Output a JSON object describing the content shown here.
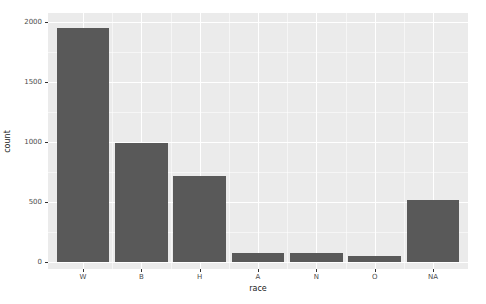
{
  "figure": {
    "background": "#FFFFFF"
  },
  "chart_data": {
    "type": "bar",
    "categories": [
      "W",
      "B",
      "H",
      "A",
      "N",
      "O",
      "NA"
    ],
    "values": [
      1948,
      995,
      720,
      78,
      72,
      50,
      520
    ],
    "title": "",
    "xlabel": "race",
    "ylabel": "count",
    "ylim": [
      -58,
      2075
    ],
    "y_major_ticks": [
      0,
      500,
      1000,
      1500,
      2000
    ],
    "y_minor_ticks": [
      250,
      750,
      1250,
      1750
    ],
    "grid": true,
    "legend": false,
    "colors": {
      "bar_fill": "#595959",
      "panel_background": "#EBEBEB",
      "grid_major": "#FFFFFF",
      "grid_minor": "rgba(255,255,255,0.55)",
      "tick_label_text": "#4D4D4D",
      "axis_title_text": "#1A1A1A",
      "tick_mark": "#333333"
    }
  }
}
